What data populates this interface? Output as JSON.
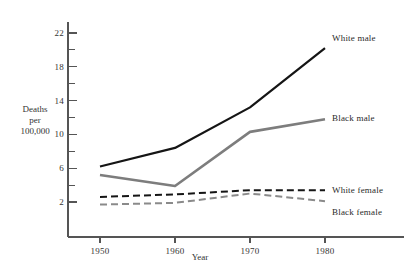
{
  "chart_data": {
    "type": "line",
    "title": "",
    "xlabel": "Year",
    "ylabel": "Deaths per 100,000",
    "ylabel_lines": [
      "Deaths",
      "per",
      "100,000"
    ],
    "x": [
      1950,
      1960,
      1970,
      1980
    ],
    "xtick_labels": [
      "1950",
      "1960",
      "1970",
      "1980"
    ],
    "ytick_labels": [
      "2",
      "6",
      "10",
      "14",
      "18",
      "22"
    ],
    "ytick_values": [
      2,
      6,
      10,
      14,
      18,
      22
    ],
    "yminor_values": [
      4,
      8,
      12,
      16,
      20,
      24
    ],
    "xlim": [
      1945,
      1985
    ],
    "ylim": [
      0.5,
      24
    ],
    "grid": false,
    "legend_position": "right-inline",
    "series": [
      {
        "name": "White male",
        "values": [
          6.2,
          8.4,
          13.2,
          20.2
        ],
        "color": "#151515",
        "style": "solid",
        "width": 2.2,
        "label_x": 332,
        "label_y": 33
      },
      {
        "name": "Black male",
        "values": [
          5.2,
          3.9,
          10.3,
          11.8
        ],
        "color": "#7d7d7d",
        "style": "solid",
        "width": 2.6,
        "label_x": 332,
        "label_y": 113
      },
      {
        "name": "White female",
        "values": [
          2.6,
          2.9,
          3.4,
          3.4
        ],
        "color": "#151515",
        "style": "dashed",
        "width": 2.0,
        "label_x": 332,
        "label_y": 185
      },
      {
        "name": "Black female",
        "values": [
          1.7,
          1.9,
          3.0,
          2.1
        ],
        "color": "#8a8a8a",
        "style": "dashed",
        "width": 2.0,
        "label_x": 332,
        "label_y": 207
      }
    ]
  },
  "colors": {
    "background": "#ffffff",
    "axis": "#555555",
    "text": "#2a2a2a"
  }
}
